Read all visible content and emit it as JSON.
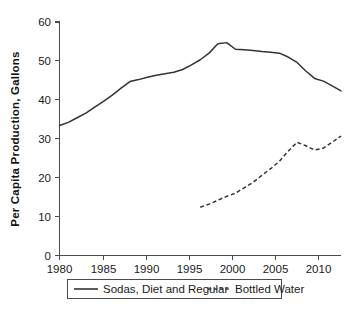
{
  "chart_data": {
    "type": "line",
    "title": "",
    "xlabel": "",
    "ylabel": "Per Capita  Production, Gallons",
    "xlim": [
      1980,
      2012
    ],
    "ylim": [
      0,
      60
    ],
    "grid": false,
    "legend_position": "bottom",
    "x_ticks": [
      "1980",
      "1985",
      "1990",
      "1995",
      "2000",
      "2005",
      "2010"
    ],
    "x_tick_values": [
      1980,
      1985,
      1990,
      1995,
      2000,
      2005,
      2010
    ],
    "y_ticks": [
      "0",
      "10",
      "20",
      "30",
      "40",
      "50",
      "60"
    ],
    "y_tick_values": [
      0,
      10,
      20,
      30,
      40,
      50,
      60
    ],
    "x": [
      1980,
      1981,
      1982,
      1983,
      1984,
      1985,
      1986,
      1987,
      1988,
      1989,
      1990,
      1991,
      1992,
      1993,
      1994,
      1995,
      1996,
      1997,
      1998,
      1999,
      2000,
      2001,
      2002,
      2003,
      2004,
      2005,
      2006,
      2007,
      2008,
      2009,
      2010,
      2011,
      2012
    ],
    "series": [
      {
        "name": "Sodas, Diet and Regular",
        "style": "solid",
        "color": "#333333",
        "x": [
          1980,
          1981,
          1982,
          1983,
          1984,
          1985,
          1986,
          1987,
          1988,
          1989,
          1990,
          1991,
          1992,
          1993,
          1994,
          1995,
          1996,
          1997,
          1998,
          1999,
          2000,
          2001,
          2002,
          2003,
          2004,
          2005,
          2006,
          2007,
          2008,
          2009,
          2010,
          2011,
          2012
        ],
        "values": [
          33.4,
          34.2,
          35.4,
          36.6,
          38.1,
          39.6,
          41.2,
          43.0,
          44.7,
          45.2,
          45.8,
          46.3,
          46.7,
          47.1,
          47.8,
          49.0,
          50.3,
          52.0,
          54.4,
          54.7,
          53.0,
          52.9,
          52.7,
          52.4,
          52.2,
          52.0,
          51.0,
          49.6,
          47.4,
          45.5,
          44.8,
          43.6,
          42.3
        ]
      },
      {
        "name": "Bottled Water",
        "style": "dashed",
        "color": "#333333",
        "x": [
          1996,
          1997,
          1998,
          1999,
          2000,
          2001,
          2002,
          2003,
          2004,
          2005,
          2006,
          2007,
          2008,
          2009,
          2010,
          2011,
          2012
        ],
        "values": [
          12.4,
          13.2,
          14.2,
          15.2,
          16.0,
          17.4,
          18.8,
          20.6,
          22.3,
          24.2,
          26.8,
          29.1,
          28.2,
          27.1,
          27.6,
          29.1,
          30.7
        ]
      }
    ]
  },
  "legend": {
    "entries": [
      {
        "label": "Sodas, Diet and Regular",
        "style": "solid"
      },
      {
        "label": "Bottled Water",
        "style": "dashed"
      }
    ]
  }
}
